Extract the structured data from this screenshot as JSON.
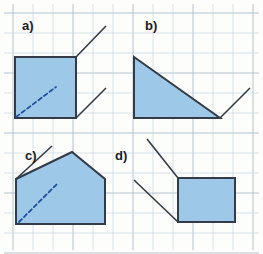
{
  "figure": {
    "width": 263,
    "height": 254,
    "background_color": "#fdfdfb",
    "grid": {
      "visible": true,
      "cell_size": 20,
      "minor_color": "#c9d6e3",
      "major_color": "#aebdcb",
      "origin_x": 13,
      "origin_y": 13,
      "columns": 12,
      "rows": 12
    },
    "style": {
      "fill_color": "#9ec8e8",
      "stroke_color": "#333b47",
      "stroke_width": 2,
      "dashed_color": "#1f4e9c",
      "label_color": "#1b1b1b",
      "thin_stroke_width": 1.6
    }
  },
  "panels": [
    {
      "id": "a",
      "label": "a)",
      "label_x": 22,
      "label_y": 30,
      "shape_name": "square",
      "shape_points": "15,57 76,57 76,118 15,118",
      "dashed_line": {
        "x1": 16,
        "y1": 117,
        "x2": 56,
        "y2": 87
      },
      "rays": [
        {
          "name": "ray-from-top-right",
          "x1": 76,
          "y1": 57,
          "x2": 106,
          "y2": 26
        },
        {
          "name": "ray-from-bottom-right",
          "x1": 76,
          "y1": 118,
          "x2": 106,
          "y2": 88
        }
      ]
    },
    {
      "id": "b",
      "label": "b)",
      "label_x": 145,
      "label_y": 30,
      "shape_name": "right-triangle",
      "shape_points": "134,57 220,118 134,118",
      "dashed_line": null,
      "rays": [
        {
          "name": "ray-from-bottom-right",
          "x1": 220,
          "y1": 118,
          "x2": 250,
          "y2": 88
        }
      ]
    },
    {
      "id": "c",
      "label": "c)",
      "label_x": 25,
      "label_y": 160,
      "shape_name": "pentagon-house",
      "shape_points": "16,179 72,152 105,179 105,224 16,224",
      "dashed_line": {
        "x1": 19,
        "y1": 222,
        "x2": 58,
        "y2": 183
      },
      "rays": [
        {
          "name": "ray-from-left-shoulder",
          "x1": 16,
          "y1": 179,
          "x2": 52,
          "y2": 146
        }
      ]
    },
    {
      "id": "d",
      "label": "d)",
      "label_x": 115,
      "label_y": 160,
      "shape_name": "rectangle",
      "shape_points": "178,178 235,178 235,222 178,222",
      "dashed_line": null,
      "rays": [
        {
          "name": "ray-from-top-left",
          "x1": 178,
          "y1": 178,
          "x2": 147,
          "y2": 139
        },
        {
          "name": "ray-from-bottom-left",
          "x1": 178,
          "y1": 222,
          "x2": 134,
          "y2": 180
        }
      ]
    }
  ]
}
